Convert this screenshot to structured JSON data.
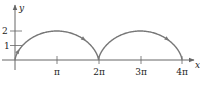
{
  "chart_data": {
    "type": "line",
    "title": "",
    "xlabel": "x",
    "ylabel": "y",
    "xlim": [
      0,
      12.566
    ],
    "ylim": [
      0,
      2
    ],
    "grid": false,
    "legend": null,
    "series": [
      {
        "name": "cycloid x = t - sin t, y = 1 - cos t",
        "parametric": true,
        "t_range": [
          0,
          12.566
        ],
        "x": [
          0,
          0.215,
          1.571,
          3.142,
          4.712,
          6.068,
          6.283,
          6.498,
          7.854,
          9.425,
          10.996,
          12.352,
          12.566
        ],
        "y": [
          0,
          0.293,
          1,
          2,
          1,
          0.293,
          0,
          0.293,
          1,
          2,
          1,
          0.293,
          0
        ],
        "color": "#777777",
        "direction_arrows": true
      }
    ],
    "x_ticks": [
      {
        "value": 3.1416,
        "label": "π"
      },
      {
        "value": 6.2832,
        "label": "2π"
      },
      {
        "value": 9.4248,
        "label": "3π"
      },
      {
        "value": 12.5664,
        "label": "4π"
      }
    ],
    "y_ticks": [
      {
        "value": 1,
        "label": "1"
      },
      {
        "value": 2,
        "label": "2"
      }
    ]
  },
  "colors": {
    "curve": "#777777",
    "axis": "#666666",
    "text": "#222222"
  }
}
